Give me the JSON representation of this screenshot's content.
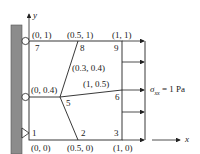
{
  "diagram": {
    "title": "",
    "axes": {
      "x_label": "x",
      "y_label": "y"
    },
    "load": {
      "symbol": "σ",
      "subscript": "xx",
      "value_text": " = 1 Pa"
    },
    "coordinates": {
      "c00": "(0, 0)",
      "c050": "(0.5, 0)",
      "c10": "(1, 0)",
      "c004": "(0, 0.4)",
      "c105": "(1, 0.5)",
      "c0304": "(0.3, 0.4)",
      "c01": "(0, 1)",
      "c051": "(0.5, 1)",
      "c11": "(1, 1)"
    },
    "nodes": {
      "n1": "1",
      "n2": "2",
      "n3": "3",
      "n5": "5",
      "n6": "6",
      "n7": "7",
      "n8": "8",
      "n9": "9"
    },
    "colors": {
      "wall": "#8c8c8c",
      "line": "#222222"
    }
  }
}
